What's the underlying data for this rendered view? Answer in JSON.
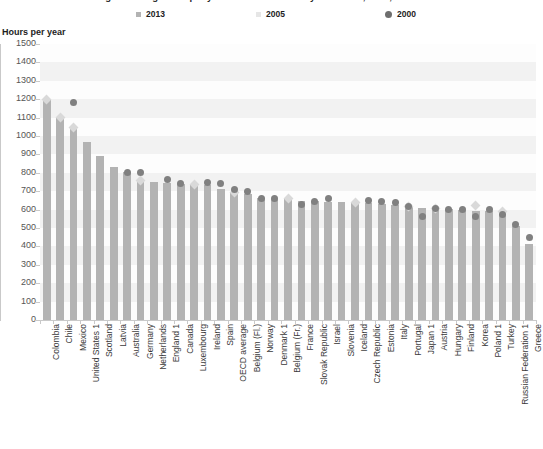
{
  "chart_title": "Average teaching hours per year in lower secondary education, 2013, 2005 and 2000",
  "axis_title": "Hours per year",
  "legend": [
    {
      "label": "2013",
      "marker": "square",
      "color": "#b3b3b3"
    },
    {
      "label": "2005",
      "marker": "square",
      "color": "#e0e0e0"
    },
    {
      "label": "2000",
      "marker": "circle",
      "color": "#6e6e6e"
    }
  ],
  "colors": {
    "bar_2013": "#b3b3b3",
    "marker_2005": "#d9d9d9",
    "marker_2000": "#808080",
    "gridband": "#f2f2f2",
    "axis": "#c9c9c9",
    "label_text": "#3a3a3a",
    "tick_text": "#555555"
  },
  "chart_data": {
    "type": "bar",
    "title": "Average teaching hours per year in lower secondary education, 2013, 2005 and 2000",
    "xlabel": "",
    "ylabel": "Hours per year",
    "ylim": [
      0,
      1500
    ],
    "yticks": [
      0,
      100,
      200,
      300,
      400,
      500,
      600,
      700,
      800,
      900,
      1000,
      1100,
      1200,
      1300,
      1400,
      1500
    ],
    "grid": true,
    "legend_position": "top",
    "categories": [
      "Colombia",
      "Chile",
      "Mexico",
      "United States 1",
      "Scotland",
      "Latvia",
      "Australia",
      "Germany",
      "Netherlands",
      "England 1",
      "Canada",
      "Luxembourg",
      "Ireland",
      "Spain",
      "OECD average",
      "Belgium (Fl.)",
      "Norway",
      "Denmark 1",
      "Belgium (Fr.)",
      "France",
      "Slovak Republic",
      "Israel",
      "Slovenia",
      "Iceland",
      "Czech Republic",
      "Estonia",
      "Italy",
      "Portugal",
      "Japan 1",
      "Austria",
      "Hungary",
      "Finland",
      "Korea",
      "Poland 1",
      "Turkey",
      "Russian Federation 1",
      "Greece"
    ],
    "series": [
      {
        "name": "2013",
        "type": "bar",
        "values": [
          1200,
          1103,
          1047,
          966,
          893,
          830,
          803,
          756,
          750,
          744,
          740,
          739,
          735,
          713,
          694,
          683,
          663,
          660,
          659,
          648,
          645,
          643,
          642,
          637,
          635,
          629,
          626,
          617,
          610,
          607,
          604,
          600,
          595,
          590,
          574,
          512,
          415
        ]
      },
      {
        "name": "2005",
        "type": "marker",
        "marker": "diamond",
        "values": [
          1200,
          1103,
          1047,
          null,
          null,
          null,
          null,
          756,
          null,
          null,
          null,
          739,
          null,
          null,
          694,
          null,
          null,
          null,
          659,
          null,
          null,
          null,
          null,
          637,
          null,
          null,
          null,
          617,
          null,
          607,
          null,
          null,
          625,
          null,
          590,
          null,
          null
        ]
      },
      {
        "name": "2000",
        "type": "marker",
        "marker": "circle",
        "values": [
          null,
          null,
          1182,
          null,
          null,
          null,
          803,
          800,
          null,
          766,
          740,
          null,
          750,
          741,
          711,
          700,
          660,
          663,
          null,
          626,
          645,
          663,
          null,
          null,
          650,
          645,
          637,
          617,
          560,
          607,
          600,
          598,
          562,
          600,
          574,
          518,
          447
        ]
      }
    ]
  }
}
